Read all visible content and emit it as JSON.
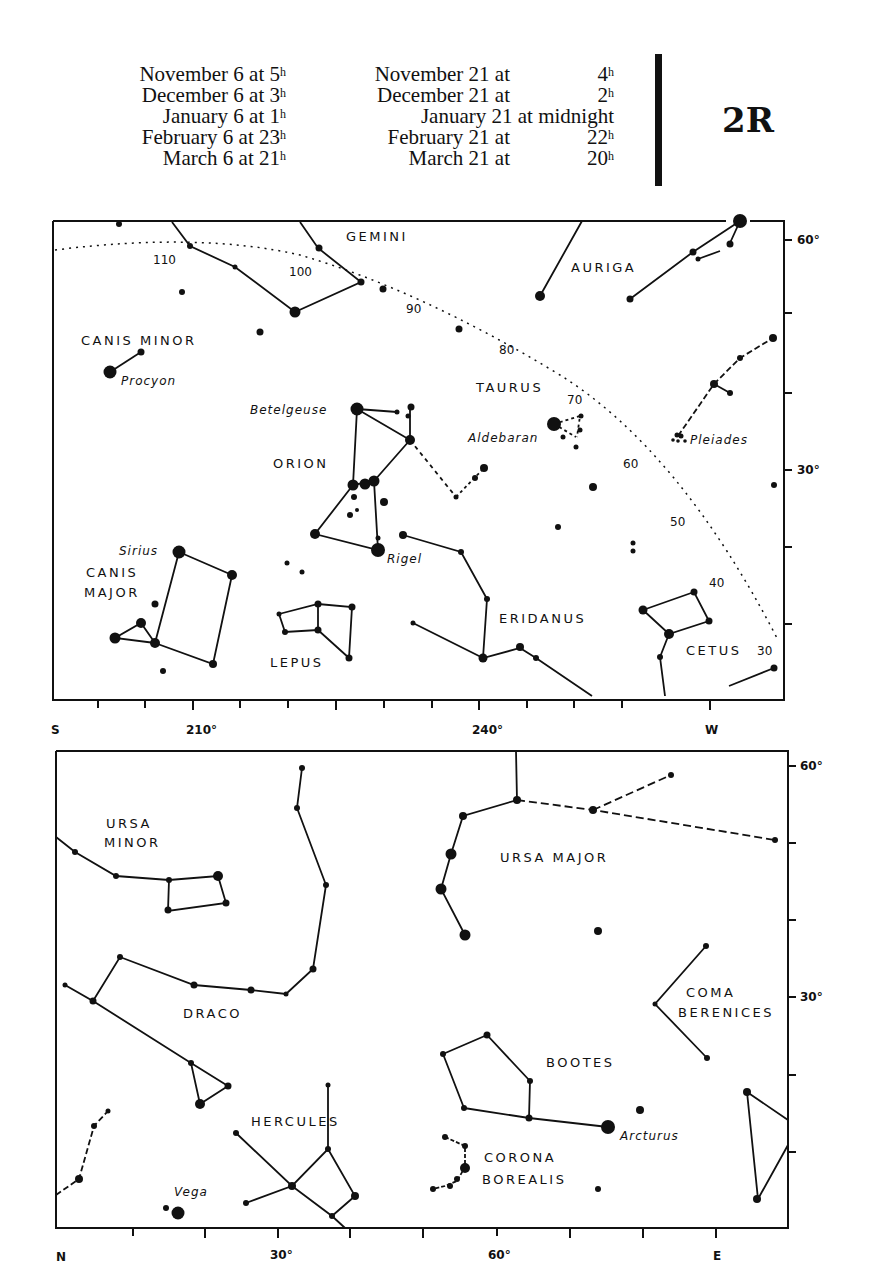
{
  "header": {
    "plate_id": "2R",
    "times_left": [
      {
        "label": "November 6 at",
        "hour": "5",
        "unit": "h"
      },
      {
        "label": "December 6 at",
        "hour": "3",
        "unit": "h"
      },
      {
        "label": "January 6 at",
        "hour": "1",
        "unit": "h"
      },
      {
        "label": "February 6 at",
        "hour": "23",
        "unit": "h"
      },
      {
        "label": "March 6 at",
        "hour": "21",
        "unit": "h"
      }
    ],
    "times_right": [
      {
        "label": "November 21 at",
        "hour": "4",
        "unit": "h"
      },
      {
        "label": "December 21 at",
        "hour": "2",
        "unit": "h"
      },
      {
        "label": "January 21 at midnight",
        "hour": "",
        "unit": ""
      },
      {
        "label": "February 21 at",
        "hour": "22",
        "unit": "h"
      },
      {
        "label": "March 21 at",
        "hour": "20",
        "unit": "h"
      }
    ]
  },
  "south_chart": {
    "constellations": [
      "GEMINI",
      "AURIGA",
      "CANIS MINOR",
      "TAURUS",
      "ORION",
      "CANIS",
      "MAJOR",
      "LEPUS",
      "ERIDANUS",
      "CETUS"
    ],
    "stars": [
      "Procyon",
      "Betelgeuse",
      "Aldebaran",
      "Pleiades",
      "Sirius",
      "Rigel"
    ],
    "ecliptic_marks": [
      "110",
      "100",
      "90",
      "80",
      "70",
      "60",
      "50",
      "40",
      "30"
    ],
    "x_axis": {
      "left": "S",
      "mid1": "210°",
      "mid2": "240°",
      "right": "W"
    },
    "y_axis": {
      "top": "60°",
      "mid": "30°"
    }
  },
  "north_chart": {
    "constellations": [
      "URSA",
      "MINOR",
      "URSA MAJOR",
      "DRACO",
      "COMA",
      "BERENICES",
      "BOOTES",
      "HERCULES",
      "CORONA",
      "BOREALIS"
    ],
    "stars": [
      "Vega",
      "Arcturus"
    ],
    "x_axis": {
      "left": "N",
      "mid1": "30°",
      "mid2": "60°",
      "right": "E"
    },
    "y_axis": {
      "top": "60°",
      "mid": "30°"
    }
  }
}
